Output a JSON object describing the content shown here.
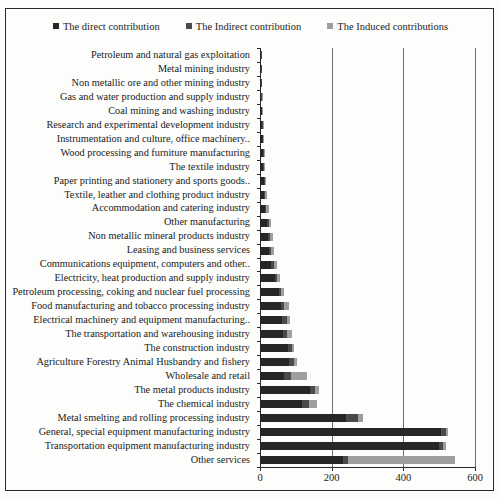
{
  "legend": {
    "items": [
      {
        "label": "The direct contribution",
        "color": "#262626",
        "icon": "square-marker-icon"
      },
      {
        "label": "The Indirect contribution",
        "color": "#4a4a4a",
        "icon": "square-marker-icon"
      },
      {
        "label": "The Induced contributions",
        "color": "#9e9e9e",
        "icon": "square-marker-icon"
      }
    ]
  },
  "chart_data": {
    "type": "bar",
    "orientation": "horizontal",
    "stacked": true,
    "title": "",
    "xlabel": "",
    "ylabel": "",
    "xlim": [
      0,
      600
    ],
    "xticks": [
      0,
      200,
      400,
      600
    ],
    "xtick_labels": [
      "0",
      "200",
      "400",
      "600"
    ],
    "grid": true,
    "grid_axis": "x",
    "legend_position": "top-center",
    "categories": [
      "Petroleum and natural gas exploitation",
      "Metal mining industry",
      "Non metallic ore and other mining industry",
      "Gas and water production and supply industry",
      "Coal mining and washing industry",
      "Research and experimental development industry",
      "Instrumentation and culture, office machinery..",
      "Wood processing and furniture manufacturing",
      "The textile industry",
      "Paper printing and stationery and sports goods..",
      "Textile, leather and clothing product industry",
      "Accommodation and catering industry",
      "Other manufacturing",
      "Non metallic mineral products industry",
      "Leasing and business services",
      "Communications equipment, computers and other..",
      "Electricity, heat production and supply industry",
      "Petroleum processing, coking and nuclear fuel processing",
      "Food manufacturing and tobacco processing industry",
      "Electrical machinery and equipment manufacturing..",
      "The transportation and warehousing industry",
      "The construction industry",
      "Agriculture Forestry Animal Husbandry and fishery",
      "Wholesale and retail",
      "The metal products industry",
      "The chemical industry",
      "Metal smelting and rolling processing industry",
      "General, special equipment manufacturing industry",
      "Transportation equipment manufacturing industry",
      "Other services"
    ],
    "series": [
      {
        "name": "The direct contribution",
        "color": "#262626",
        "values": [
          2,
          2,
          3,
          4,
          5,
          6,
          7,
          8,
          9,
          10,
          12,
          14,
          20,
          22,
          24,
          30,
          42,
          52,
          58,
          62,
          64,
          78,
          80,
          66,
          140,
          118,
          240,
          505,
          500,
          233
        ]
      },
      {
        "name": "The Indirect contribution",
        "color": "#4a4a4a",
        "values": [
          1,
          1,
          1,
          1,
          1,
          1,
          2,
          2,
          2,
          3,
          3,
          4,
          4,
          5,
          6,
          8,
          6,
          8,
          10,
          12,
          12,
          12,
          14,
          20,
          14,
          18,
          34,
          14,
          12,
          12
        ]
      },
      {
        "name": "The Induced contributions",
        "color": "#9e9e9e",
        "values": [
          0,
          0,
          0,
          1,
          1,
          1,
          1,
          1,
          2,
          3,
          5,
          7,
          8,
          9,
          10,
          9,
          7,
          8,
          12,
          10,
          14,
          6,
          8,
          44,
          12,
          22,
          14,
          6,
          8,
          300
        ]
      }
    ]
  }
}
